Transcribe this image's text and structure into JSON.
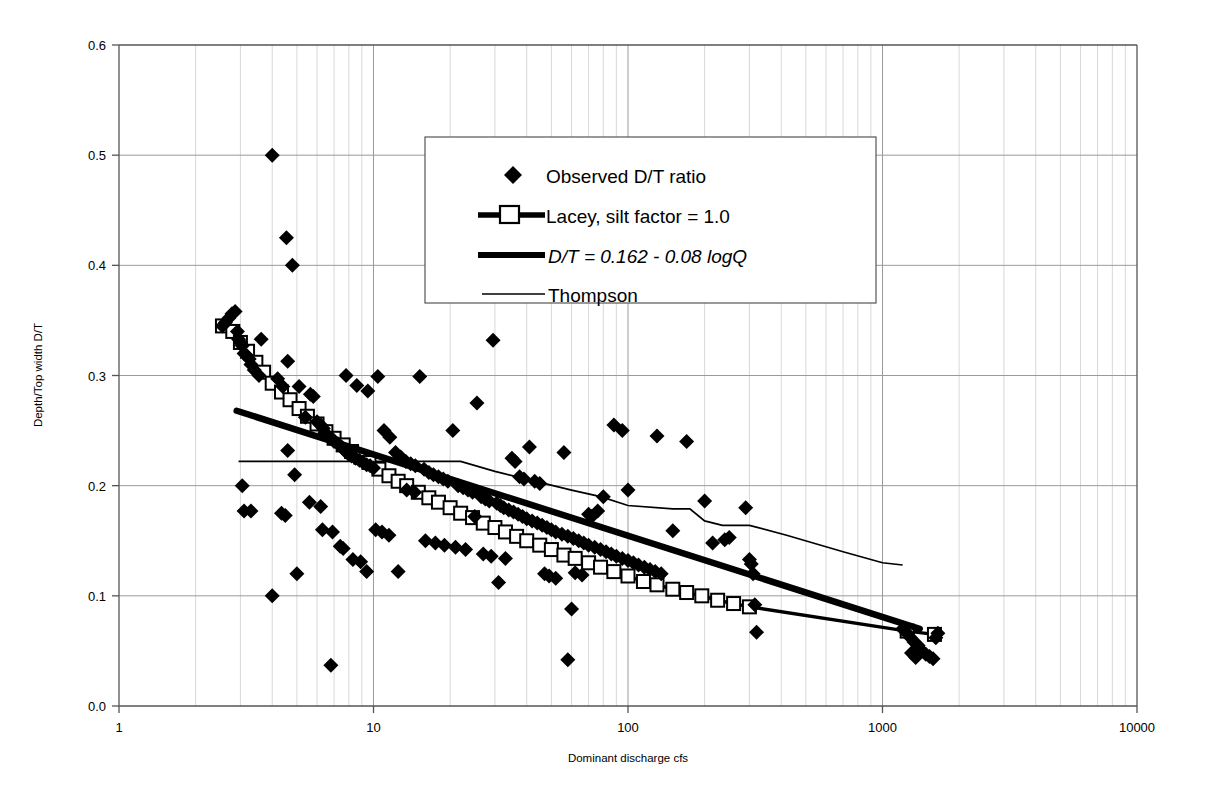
{
  "chart_data": {
    "type": "scatter",
    "title": "",
    "xlabel": "Dominant discharge cfs",
    "ylabel": "Depth/Top width D/T",
    "xscale": "log",
    "yscale": "linear",
    "xlim": [
      1,
      10000
    ],
    "ylim": [
      0.0,
      0.6
    ],
    "xticks": [
      1,
      10,
      100,
      1000,
      10000
    ],
    "xtick_labels": [
      "1",
      "10",
      "100",
      "1000",
      "10000"
    ],
    "yticks": [
      0.0,
      0.1,
      0.2,
      0.3,
      0.4,
      0.5,
      0.6
    ],
    "ytick_labels": [
      "0.0",
      "0.1",
      "0.2",
      "0.3",
      "0.4",
      "0.5",
      "0.6"
    ],
    "grid": "major horizontal lines and log minor vertical lines",
    "legend_position": "upper-center",
    "legend": [
      {
        "label": "Observed D/T ratio",
        "marker": "filled-diamond",
        "style": "marker-only"
      },
      {
        "label": "Lacey, silt factor = 1.0",
        "marker": "open-square",
        "style": "thick-line-with-marker"
      },
      {
        "label": "D/T = 0.162  -  0.08  logQ",
        "marker": "none",
        "style": "thick-line",
        "italic": true
      },
      {
        "label": "Thompson",
        "marker": "none",
        "style": "thin-line"
      }
    ],
    "series": [
      {
        "name": "Observed D/T ratio",
        "type": "scatter",
        "marker": "filled-diamond",
        "points": [
          [
            2.55,
            0.345
          ],
          [
            2.62,
            0.348
          ],
          [
            2.7,
            0.352
          ],
          [
            2.78,
            0.356
          ],
          [
            2.86,
            0.358
          ],
          [
            2.92,
            0.34
          ],
          [
            2.95,
            0.333
          ],
          [
            3.0,
            0.33
          ],
          [
            3.05,
            0.327
          ],
          [
            3.1,
            0.32
          ],
          [
            3.18,
            0.318
          ],
          [
            3.25,
            0.315
          ],
          [
            3.3,
            0.31
          ],
          [
            3.4,
            0.305
          ],
          [
            3.55,
            0.3
          ],
          [
            3.62,
            0.333
          ],
          [
            4.0,
            0.5
          ],
          [
            4.2,
            0.297
          ],
          [
            4.4,
            0.29
          ],
          [
            4.55,
            0.425
          ],
          [
            4.6,
            0.313
          ],
          [
            4.8,
            0.4
          ],
          [
            4.6,
            0.232
          ],
          [
            4.9,
            0.21
          ],
          [
            5.1,
            0.29
          ],
          [
            5.4,
            0.262
          ],
          [
            5.65,
            0.283
          ],
          [
            5.8,
            0.281
          ],
          [
            6.0,
            0.258
          ],
          [
            6.2,
            0.255
          ],
          [
            6.35,
            0.252
          ],
          [
            6.45,
            0.248
          ],
          [
            6.6,
            0.245
          ],
          [
            6.85,
            0.243
          ],
          [
            7.0,
            0.24
          ],
          [
            7.25,
            0.238
          ],
          [
            7.5,
            0.235
          ],
          [
            7.7,
            0.232
          ],
          [
            7.95,
            0.229
          ],
          [
            8.2,
            0.227
          ],
          [
            8.5,
            0.225
          ],
          [
            8.8,
            0.223
          ],
          [
            9.1,
            0.221
          ],
          [
            9.4,
            0.219
          ],
          [
            9.7,
            0.218
          ],
          [
            10.0,
            0.216
          ],
          [
            7.8,
            0.3
          ],
          [
            8.6,
            0.291
          ],
          [
            9.5,
            0.286
          ],
          [
            10.4,
            0.299
          ],
          [
            11.0,
            0.25
          ],
          [
            11.6,
            0.244
          ],
          [
            12.2,
            0.23
          ],
          [
            12.8,
            0.226
          ],
          [
            13.4,
            0.222
          ],
          [
            14.0,
            0.22
          ],
          [
            14.6,
            0.218
          ],
          [
            15.2,
            0.299
          ],
          [
            15.8,
            0.215
          ],
          [
            16.5,
            0.212
          ],
          [
            17.2,
            0.21
          ],
          [
            18.0,
            0.208
          ],
          [
            18.8,
            0.206
          ],
          [
            19.6,
            0.204
          ],
          [
            20.5,
            0.25
          ],
          [
            21.5,
            0.2
          ],
          [
            22.5,
            0.198
          ],
          [
            23.5,
            0.196
          ],
          [
            24.5,
            0.194
          ],
          [
            25.5,
            0.275
          ],
          [
            26.5,
            0.19
          ],
          [
            27.5,
            0.188
          ],
          [
            28.5,
            0.186
          ],
          [
            29.5,
            0.332
          ],
          [
            30.5,
            0.184
          ],
          [
            31.5,
            0.182
          ],
          [
            32.5,
            0.18
          ],
          [
            34.0,
            0.178
          ],
          [
            35.5,
            0.176
          ],
          [
            37.0,
            0.174
          ],
          [
            38.5,
            0.172
          ],
          [
            40.0,
            0.17
          ],
          [
            42.0,
            0.168
          ],
          [
            44.0,
            0.166
          ],
          [
            46.0,
            0.164
          ],
          [
            48.0,
            0.162
          ],
          [
            50.0,
            0.16
          ],
          [
            52.0,
            0.158
          ],
          [
            55.0,
            0.156
          ],
          [
            58.0,
            0.154
          ],
          [
            61.0,
            0.152
          ],
          [
            64.0,
            0.15
          ],
          [
            67.0,
            0.148
          ],
          [
            70.0,
            0.146
          ],
          [
            74.0,
            0.144
          ],
          [
            78.0,
            0.142
          ],
          [
            82.0,
            0.14
          ],
          [
            86.0,
            0.138
          ],
          [
            90.0,
            0.136
          ],
          [
            95.0,
            0.134
          ],
          [
            100.0,
            0.132
          ],
          [
            105.0,
            0.13
          ],
          [
            110.0,
            0.128
          ],
          [
            116.0,
            0.126
          ],
          [
            122.0,
            0.124
          ],
          [
            128.0,
            0.122
          ],
          [
            135.0,
            0.12
          ],
          [
            3.05,
            0.2
          ],
          [
            3.1,
            0.177
          ],
          [
            3.3,
            0.177
          ],
          [
            4.0,
            0.1
          ],
          [
            4.35,
            0.175
          ],
          [
            4.5,
            0.173
          ],
          [
            5.0,
            0.12
          ],
          [
            5.6,
            0.185
          ],
          [
            6.2,
            0.181
          ],
          [
            6.8,
            0.037
          ],
          [
            6.3,
            0.16
          ],
          [
            6.9,
            0.158
          ],
          [
            7.4,
            0.145
          ],
          [
            7.6,
            0.143
          ],
          [
            8.3,
            0.133
          ],
          [
            8.9,
            0.131
          ],
          [
            9.4,
            0.122
          ],
          [
            10.2,
            0.16
          ],
          [
            10.8,
            0.158
          ],
          [
            11.5,
            0.155
          ],
          [
            12.5,
            0.122
          ],
          [
            13.5,
            0.196
          ],
          [
            14.5,
            0.194
          ],
          [
            16.0,
            0.15
          ],
          [
            17.5,
            0.148
          ],
          [
            19.0,
            0.146
          ],
          [
            21.0,
            0.144
          ],
          [
            23.0,
            0.142
          ],
          [
            25.0,
            0.172
          ],
          [
            27.0,
            0.138
          ],
          [
            29.0,
            0.136
          ],
          [
            31.0,
            0.112
          ],
          [
            33.0,
            0.134
          ],
          [
            35.0,
            0.225
          ],
          [
            36.0,
            0.222
          ],
          [
            37.5,
            0.208
          ],
          [
            39.0,
            0.206
          ],
          [
            41.0,
            0.235
          ],
          [
            43.0,
            0.204
          ],
          [
            45.0,
            0.202
          ],
          [
            47.0,
            0.12
          ],
          [
            49.0,
            0.118
          ],
          [
            52.0,
            0.116
          ],
          [
            56.0,
            0.23
          ],
          [
            58.0,
            0.042
          ],
          [
            60.0,
            0.088
          ],
          [
            62.0,
            0.121
          ],
          [
            66.0,
            0.119
          ],
          [
            70.0,
            0.174
          ],
          [
            72.0,
            0.172
          ],
          [
            76.0,
            0.177
          ],
          [
            80.0,
            0.19
          ],
          [
            88.0,
            0.255
          ],
          [
            95.0,
            0.25
          ],
          [
            100.0,
            0.196
          ],
          [
            130.0,
            0.245
          ],
          [
            150.0,
            0.159
          ],
          [
            170.0,
            0.24
          ],
          [
            200.0,
            0.186
          ],
          [
            215.0,
            0.148
          ],
          [
            240.0,
            0.151
          ],
          [
            250.0,
            0.153
          ],
          [
            290.0,
            0.18
          ],
          [
            300.0,
            0.133
          ],
          [
            305.0,
            0.129
          ],
          [
            310.0,
            0.12
          ],
          [
            315.0,
            0.092
          ],
          [
            320.0,
            0.067
          ],
          [
            1200.0,
            0.07
          ],
          [
            1250.0,
            0.066
          ],
          [
            1290.0,
            0.062
          ],
          [
            1330.0,
            0.058
          ],
          [
            1380.0,
            0.055
          ],
          [
            1430.0,
            0.05
          ],
          [
            1480.0,
            0.047
          ],
          [
            1530.0,
            0.045
          ],
          [
            1580.0,
            0.043
          ],
          [
            1620.0,
            0.062
          ],
          [
            1650.0,
            0.066
          ],
          [
            1300.0,
            0.048
          ],
          [
            1350.0,
            0.044
          ]
        ]
      },
      {
        "name": "Lacey, silt factor = 1.0",
        "type": "line",
        "marker": "open-square",
        "points": [
          [
            2.55,
            0.345
          ],
          [
            2.8,
            0.34
          ],
          [
            3.0,
            0.33
          ],
          [
            3.2,
            0.322
          ],
          [
            3.45,
            0.312
          ],
          [
            3.7,
            0.303
          ],
          [
            4.0,
            0.293
          ],
          [
            4.35,
            0.285
          ],
          [
            4.7,
            0.278
          ],
          [
            5.1,
            0.27
          ],
          [
            5.5,
            0.263
          ],
          [
            6.0,
            0.256
          ],
          [
            6.5,
            0.249
          ],
          [
            7.0,
            0.243
          ],
          [
            7.6,
            0.237
          ],
          [
            8.2,
            0.231
          ],
          [
            8.9,
            0.226
          ],
          [
            9.6,
            0.221
          ],
          [
            10.5,
            0.215
          ],
          [
            11.5,
            0.209
          ],
          [
            12.5,
            0.204
          ],
          [
            13.5,
            0.2
          ],
          [
            15.0,
            0.194
          ],
          [
            16.5,
            0.189
          ],
          [
            18.0,
            0.185
          ],
          [
            20.0,
            0.18
          ],
          [
            22.0,
            0.175
          ],
          [
            24.5,
            0.171
          ],
          [
            27.0,
            0.166
          ],
          [
            30.0,
            0.162
          ],
          [
            33.0,
            0.158
          ],
          [
            36.5,
            0.154
          ],
          [
            40.0,
            0.15
          ],
          [
            45.0,
            0.146
          ],
          [
            50.0,
            0.142
          ],
          [
            56.0,
            0.137
          ],
          [
            62.0,
            0.134
          ],
          [
            70.0,
            0.13
          ],
          [
            78.0,
            0.126
          ],
          [
            88.0,
            0.122
          ],
          [
            100.0,
            0.118
          ],
          [
            115.0,
            0.113
          ],
          [
            130.0,
            0.11
          ],
          [
            150.0,
            0.106
          ],
          [
            170.0,
            0.103
          ],
          [
            195.0,
            0.1
          ],
          [
            225.0,
            0.096
          ],
          [
            260.0,
            0.093
          ],
          [
            300.0,
            0.09
          ],
          [
            1250.0,
            0.068
          ],
          [
            1600.0,
            0.065
          ]
        ]
      },
      {
        "name": "D/T = 0.162  -  0.08  logQ",
        "type": "line",
        "equation": "D/T = 0.162 - 0.08 logQ",
        "intercept": 0.162,
        "slope": -0.08,
        "points": [
          [
            2.9,
            0.268
          ],
          [
            1400.0,
            0.07
          ]
        ]
      },
      {
        "name": "Thompson",
        "type": "line",
        "points": [
          [
            2.95,
            0.222
          ],
          [
            22.0,
            0.222
          ],
          [
            30.0,
            0.213
          ],
          [
            60.0,
            0.196
          ],
          [
            78.0,
            0.19
          ],
          [
            100.0,
            0.182
          ],
          [
            150.0,
            0.179
          ],
          [
            175.0,
            0.179
          ],
          [
            200.0,
            0.168
          ],
          [
            235.0,
            0.164
          ],
          [
            300.0,
            0.164
          ],
          [
            420.0,
            0.155
          ],
          [
            700.0,
            0.14
          ],
          [
            1000.0,
            0.13
          ],
          [
            1200.0,
            0.128
          ]
        ]
      }
    ]
  },
  "style": {
    "axis_color": "#555555",
    "grid_major_color": "#9a9a9a",
    "grid_minor_color": "#d8d8d8",
    "series_color": "#000000",
    "background": "#ffffff"
  }
}
